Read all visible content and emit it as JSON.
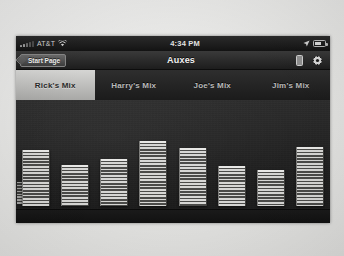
{
  "status_bar": {
    "carrier": "AT&T",
    "wifi_icon": "wifi-icon",
    "time": "4:34 PM",
    "location_icon": "location-arrow-icon",
    "battery_icon": "battery-icon"
  },
  "nav_bar": {
    "back_label": "Start Page",
    "title": "Auxes",
    "device_icon": "device-icon",
    "gear_icon": "gear-icon"
  },
  "tabs": [
    {
      "label": "Rick's Mix",
      "selected": true
    },
    {
      "label": "Harry's Mix",
      "selected": false
    },
    {
      "label": "Joe's Mix",
      "selected": false
    },
    {
      "label": "Jim's Mix",
      "selected": false
    }
  ],
  "mixer": {
    "channels": [
      {
        "label": "Kick",
        "level": 62
      },
      {
        "label": "Snare",
        "level": 46
      },
      {
        "label": "Hi Haf",
        "level": 52
      },
      {
        "label": "Tom 1",
        "level": 72
      },
      {
        "label": "Tom 2",
        "level": 64
      },
      {
        "label": "Tom 3",
        "level": 44
      },
      {
        "label": "OH L",
        "level": 40
      },
      {
        "label": "OH R",
        "level": 66
      }
    ]
  },
  "colors": {
    "screen_bg": "#232323",
    "fader_lit": "#d6d6d4",
    "selected_tab_bg": "#d5d5d3",
    "text": "#c8c8c8"
  }
}
